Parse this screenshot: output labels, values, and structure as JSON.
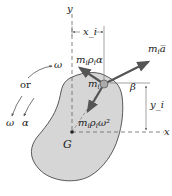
{
  "diagram": {
    "type": "rigid-body kinetics free-body / inertia diagram",
    "colors": {
      "body_fill": "#d6d6d6",
      "body_stroke": "#333333",
      "vector": "#555555",
      "particle": "#aaaaaa",
      "axis": "#666666",
      "text": "#222222"
    },
    "axes": {
      "y_label": "y",
      "x_label": "x"
    },
    "points": {
      "center_of_mass": "G",
      "particle": "m_i"
    },
    "dimensions": {
      "x_offset": "x_i",
      "y_offset": "y_i",
      "angle": "β"
    },
    "vectors": [
      {
        "name": "tangential",
        "label_main": "m",
        "label_sub1": "i",
        "label_mid": "ρ",
        "label_sub2": "i",
        "label_tail": "α"
      },
      {
        "name": "acceleration",
        "label_main": "m",
        "label_sub1": "i",
        "label_tail": "a̅"
      },
      {
        "name": "normal",
        "label_main": "m",
        "label_sub1": "i",
        "label_mid": "ρ",
        "label_sub2": "i",
        "label_tail": "ω²"
      }
    ],
    "rotation": {
      "omega_label": "ω",
      "or_label": "or",
      "omega_label_2": "ω",
      "alpha_label": "α"
    },
    "caption": "Figure"
  }
}
